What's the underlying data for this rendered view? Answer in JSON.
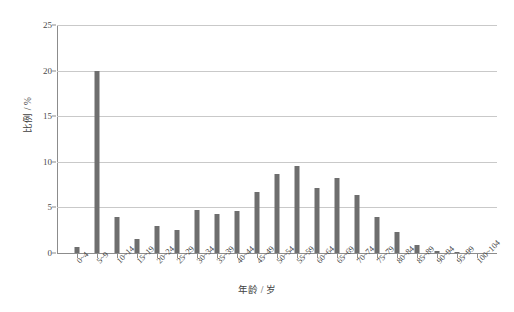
{
  "chart_data": {
    "type": "bar",
    "title": "",
    "xlabel": "年龄 / 岁",
    "ylabel": "比例 / %",
    "ylim": [
      0,
      25
    ],
    "yticks": [
      0,
      5,
      10,
      15,
      20,
      25
    ],
    "ytick_labels": [
      "0",
      "5",
      "10",
      "15",
      "20",
      "25"
    ],
    "grid": true,
    "legend": "none",
    "bar_color": "#6e6e6e",
    "categories": [
      "0~4",
      "5~9",
      "10~14",
      "15~19",
      "20~24",
      "25~29",
      "30~34",
      "35~39",
      "40~44",
      "45~49",
      "50~54",
      "55~59",
      "60~64",
      "65~69",
      "70~74",
      "75~79",
      "80~84",
      "85~89",
      "90~94",
      "95~99",
      "100~104"
    ],
    "values": [
      0.7,
      20.0,
      3.9,
      1.5,
      3.0,
      2.5,
      4.7,
      4.3,
      4.6,
      6.7,
      8.7,
      9.5,
      7.1,
      8.2,
      6.4,
      3.9,
      2.3,
      0.9,
      0.25,
      0.08,
      0.0
    ]
  }
}
